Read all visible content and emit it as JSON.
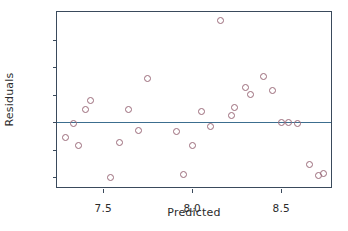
{
  "chart_data": {
    "type": "scatter",
    "title": "",
    "xlabel": "Predicted",
    "ylabel": "Residuals",
    "xlim": [
      7.24,
      8.78
    ],
    "ylim": [
      -0.47,
      0.8
    ],
    "xticks": [
      7.5,
      8.0,
      8.5
    ],
    "xticklabels": [
      "7.5",
      "8.0",
      "8.5"
    ],
    "yticks": [
      0.6,
      0.4,
      0.2,
      0.0,
      -0.2,
      -0.4
    ],
    "yticklabels": [
      "0.6",
      "0.4",
      "0.2",
      "0.0",
      "-0.2",
      "-0.4"
    ],
    "grid": false,
    "legend": null,
    "marker_style": "open-circle",
    "marker_color": "#9b6b7a",
    "reference_line": {
      "orientation": "horizontal",
      "y": 0.0,
      "color": "#3c6e8f"
    },
    "points": [
      {
        "x": 7.29,
        "y": -0.11
      },
      {
        "x": 7.33,
        "y": -0.01
      },
      {
        "x": 7.36,
        "y": -0.17
      },
      {
        "x": 7.4,
        "y": 0.09
      },
      {
        "x": 7.43,
        "y": 0.16
      },
      {
        "x": 7.54,
        "y": -0.4
      },
      {
        "x": 7.59,
        "y": -0.15
      },
      {
        "x": 7.64,
        "y": 0.09
      },
      {
        "x": 7.7,
        "y": -0.06
      },
      {
        "x": 7.75,
        "y": 0.32
      },
      {
        "x": 7.91,
        "y": -0.07
      },
      {
        "x": 7.95,
        "y": -0.38
      },
      {
        "x": 8.0,
        "y": -0.17
      },
      {
        "x": 8.05,
        "y": 0.08
      },
      {
        "x": 8.1,
        "y": -0.03
      },
      {
        "x": 8.16,
        "y": 0.74
      },
      {
        "x": 8.22,
        "y": 0.05
      },
      {
        "x": 8.24,
        "y": 0.11
      },
      {
        "x": 8.3,
        "y": 0.25
      },
      {
        "x": 8.33,
        "y": 0.2
      },
      {
        "x": 8.4,
        "y": 0.33
      },
      {
        "x": 8.45,
        "y": 0.23
      },
      {
        "x": 8.5,
        "y": 0.0
      },
      {
        "x": 8.54,
        "y": 0.0
      },
      {
        "x": 8.59,
        "y": -0.01
      },
      {
        "x": 8.66,
        "y": -0.31
      },
      {
        "x": 8.71,
        "y": -0.39
      },
      {
        "x": 8.74,
        "y": -0.37
      }
    ]
  }
}
